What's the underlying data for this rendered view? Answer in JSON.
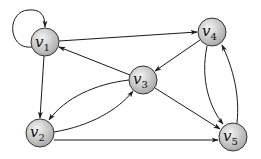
{
  "diagram": {
    "type": "directed-graph",
    "nodes": [
      {
        "id": "v1",
        "base": "v",
        "sub": "1",
        "x": 45,
        "y": 42
      },
      {
        "id": "v2",
        "base": "v",
        "sub": "2",
        "x": 40,
        "y": 133
      },
      {
        "id": "v3",
        "base": "v",
        "sub": "3",
        "x": 143,
        "y": 80
      },
      {
        "id": "v4",
        "base": "v",
        "sub": "4",
        "x": 212,
        "y": 32
      },
      {
        "id": "v5",
        "base": "v",
        "sub": "5",
        "x": 233,
        "y": 137
      }
    ],
    "edges": [
      {
        "from": "v1",
        "to": "v1",
        "style": "loop"
      },
      {
        "from": "v1",
        "to": "v4",
        "style": "straight"
      },
      {
        "from": "v1",
        "to": "v2",
        "style": "straight"
      },
      {
        "from": "v3",
        "to": "v1",
        "style": "straight"
      },
      {
        "from": "v4",
        "to": "v3",
        "style": "straight"
      },
      {
        "from": "v3",
        "to": "v2",
        "style": "curved-upper"
      },
      {
        "from": "v2",
        "to": "v3",
        "style": "curved-lower"
      },
      {
        "from": "v3",
        "to": "v5",
        "style": "straight"
      },
      {
        "from": "v2",
        "to": "v5",
        "style": "straight"
      },
      {
        "from": "v4",
        "to": "v5",
        "style": "curved-left"
      },
      {
        "from": "v5",
        "to": "v4",
        "style": "curved-right"
      }
    ],
    "colors": {
      "node_fill_center": "#f2f2f2",
      "node_fill_edge": "#a8a8a8",
      "stroke": "#1a1a1a"
    }
  },
  "labels": {
    "v1": {
      "base": "v",
      "sub": "1"
    },
    "v2": {
      "base": "v",
      "sub": "2"
    },
    "v3": {
      "base": "v",
      "sub": "3"
    },
    "v4": {
      "base": "v",
      "sub": "4"
    },
    "v5": {
      "base": "v",
      "sub": "5"
    }
  }
}
